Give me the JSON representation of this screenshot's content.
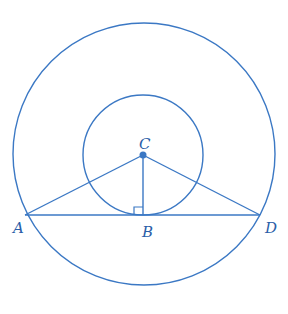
{
  "diagram": {
    "type": "geometry",
    "stroke_color": "#3b78c4",
    "label_color": "#2a5ea8",
    "points": {
      "A": {
        "label": "A"
      },
      "B": {
        "label": "B"
      },
      "C": {
        "label": "C"
      },
      "D": {
        "label": "D"
      }
    },
    "segments": [
      "CA",
      "CB",
      "CD",
      "AD"
    ],
    "right_angle_at": "B"
  }
}
